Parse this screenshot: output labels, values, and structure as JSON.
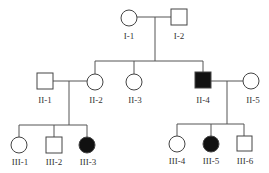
{
  "diagram": {
    "type": "pedigree",
    "individuals": [
      {
        "id": "I-1",
        "label": "I-1",
        "sex": "female",
        "affected": false
      },
      {
        "id": "I-2",
        "label": "I-2",
        "sex": "male",
        "affected": false
      },
      {
        "id": "II-1",
        "label": "II-1",
        "sex": "male",
        "affected": false
      },
      {
        "id": "II-2",
        "label": "II-2",
        "sex": "female",
        "affected": false
      },
      {
        "id": "II-3",
        "label": "II-3",
        "sex": "female",
        "affected": false
      },
      {
        "id": "II-4",
        "label": "II-4",
        "sex": "male",
        "affected": true
      },
      {
        "id": "II-5",
        "label": "II-5",
        "sex": "female",
        "affected": false
      },
      {
        "id": "III-1",
        "label": "III-1",
        "sex": "female",
        "affected": false
      },
      {
        "id": "III-2",
        "label": "III-2",
        "sex": "male",
        "affected": false
      },
      {
        "id": "III-3",
        "label": "III-3",
        "sex": "female",
        "affected": true
      },
      {
        "id": "III-4",
        "label": "III-4",
        "sex": "female",
        "affected": false
      },
      {
        "id": "III-5",
        "label": "III-5",
        "sex": "female",
        "affected": true
      },
      {
        "id": "III-6",
        "label": "III-6",
        "sex": "male",
        "affected": false
      }
    ],
    "colors": {
      "affected": "#111111",
      "unaffected": "#ffffff",
      "line": "#555555"
    }
  }
}
